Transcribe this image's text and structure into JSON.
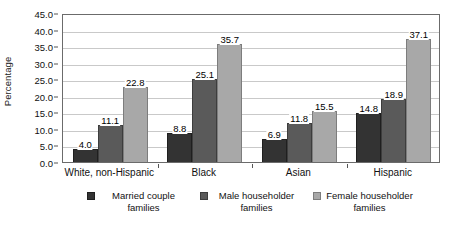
{
  "chart_data": {
    "type": "bar",
    "title": "",
    "xlabel": "",
    "ylabel": "Percentage",
    "ylim": [
      0,
      45
    ],
    "ytick_step": 5,
    "ytick_labels": [
      "0.0",
      "5.0",
      "10.0",
      "15.0",
      "20.0",
      "25.0",
      "30.0",
      "35.0",
      "40.0",
      "45.0"
    ],
    "grid": true,
    "legend_position": "bottom",
    "categories": [
      "White, non-Hispanic",
      "Black",
      "Asian",
      "Hispanic"
    ],
    "series": [
      {
        "name": "Married couple families",
        "color": "#333333",
        "values": [
          4.0,
          8.8,
          6.9,
          14.8
        ],
        "labels": [
          "4.0",
          "8.8",
          "6.9",
          "14.8"
        ]
      },
      {
        "name": "Male householder families",
        "color": "#5a5a5a",
        "values": [
          11.1,
          25.1,
          11.8,
          18.9
        ],
        "labels": [
          "11.1",
          "25.1",
          "11.8",
          "18.9"
        ]
      },
      {
        "name": "Female householder families",
        "color": "#a8a8a8",
        "values": [
          22.8,
          35.7,
          15.5,
          37.1
        ],
        "labels": [
          "22.8",
          "35.7",
          "15.5",
          "37.1"
        ]
      }
    ]
  },
  "axis": {
    "y_title": "Percentage"
  },
  "legend": {
    "items": [
      {
        "label": "Married couple families",
        "swatch": "#333333"
      },
      {
        "label": "Male householder families",
        "swatch": "#5a5a5a"
      },
      {
        "label": "Female householder families",
        "swatch": "#a8a8a8"
      }
    ]
  },
  "colors": {
    "married_couple": "#333333",
    "male_householder": "#5a5a5a",
    "female_householder": "#a8a8a8",
    "gridline": "#c9c9c9",
    "axis": "#6b6b6b",
    "background": "#ffffff"
  }
}
